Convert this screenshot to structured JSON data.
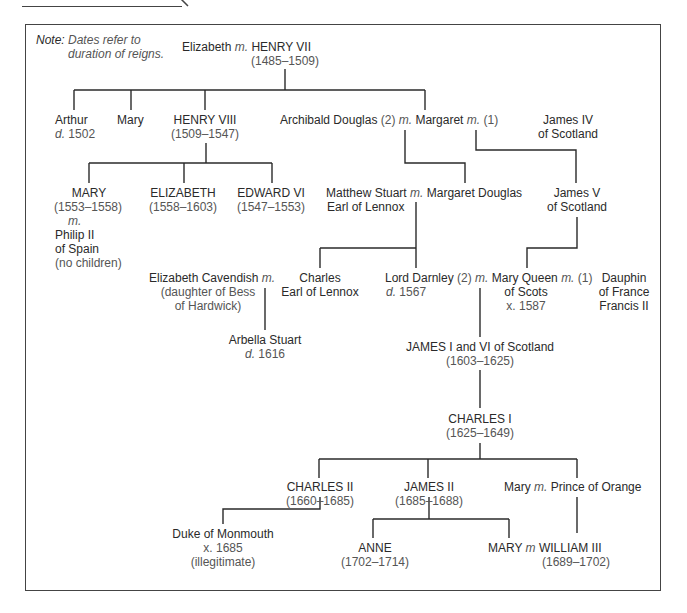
{
  "caption": {
    "text": "The Tudors and the Stuarts"
  },
  "note": {
    "label": "Note:",
    "text_line1": "Dates refer to",
    "text_line2": "duration of reigns."
  },
  "marriage_marker": "m.",
  "people": {
    "elizabeth_york": {
      "name": "Elizabeth"
    },
    "henry7": {
      "name": "HENRY VII",
      "dates": "(1485–1509)"
    },
    "arthur": {
      "name": "Arthur",
      "death_prefix": "d.",
      "death": "1502"
    },
    "mary_tudor_sister": {
      "name": "Mary"
    },
    "henry8": {
      "name": "HENRY VIII",
      "dates": "(1509–1547)"
    },
    "archibald": {
      "name": "Archibald Douglas",
      "order": "(2)"
    },
    "margaret": {
      "name": "Margaret",
      "order": "(1)"
    },
    "james4": {
      "name_line1": "James IV",
      "name_line2": "of Scotland"
    },
    "mary1": {
      "name": "MARY",
      "dates": "(1553–1558)",
      "m": "m.",
      "spouse_line1": "Philip II",
      "spouse_line2": "of Spain",
      "note": "(no children)"
    },
    "elizabeth1": {
      "name": "ELIZABETH",
      "dates": "(1558–1603)"
    },
    "edward6": {
      "name": "EDWARD VI",
      "dates": "(1547–1553)"
    },
    "matthew_stuart": {
      "name_line1": "Matthew Stuart",
      "name_line2": "Earl of Lennox"
    },
    "margaret_douglas": {
      "name": "Margaret Douglas"
    },
    "james5": {
      "name_line1": "James V",
      "name_line2": "of Scotland"
    },
    "elizabeth_cavendish": {
      "name": "Elizabeth Cavendish",
      "note_line1": "(daughter of Bess",
      "note_line2": "of Hardwick)"
    },
    "charles_lennox": {
      "name_line1": "Charles",
      "name_line2": "Earl of Lennox"
    },
    "darnley": {
      "name": "Lord Darnley",
      "order": "(2)",
      "death_prefix": "d.",
      "death": "1567"
    },
    "mary_qos": {
      "name_line1": "Mary Queen",
      "name_line2": "of Scots",
      "executed": "x. 1587",
      "order": "(1)"
    },
    "dauphin": {
      "name_line1": "Dauphin",
      "name_line2": "of France",
      "name_line3": "Francis II"
    },
    "arbella": {
      "name": "Arbella Stuart",
      "death_prefix": "d.",
      "death": "1616"
    },
    "james1": {
      "name": "JAMES I and VI of Scotland",
      "dates": "(1603–1625)"
    },
    "charles1": {
      "name": "CHARLES I",
      "dates": "(1625–1649)"
    },
    "charles2": {
      "name": "CHARLES II",
      "dates": "(1660–1685)"
    },
    "james2": {
      "name": "JAMES II",
      "dates": "(1685–1688)"
    },
    "mary_orange": {
      "name": "Mary",
      "spouse": "Prince of Orange"
    },
    "monmouth": {
      "name": "Duke of Monmouth",
      "executed": "x. 1685",
      "note": "(illegitimate)"
    },
    "anne": {
      "name": "ANNE",
      "dates": "(1702–1714)"
    },
    "mary2": {
      "name": "MARY",
      "m": "m"
    },
    "william3": {
      "name": "WILLIAM III",
      "dates": "(1689–1702)"
    }
  }
}
